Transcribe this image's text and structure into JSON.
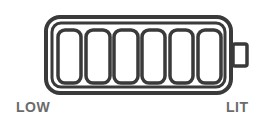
{
  "indicator": {
    "type": "battery-level",
    "segment_count": 6,
    "colors": {
      "stroke": "#3a3a3a",
      "label": "#6b6b6b",
      "background": "#ffffff"
    }
  },
  "labels": {
    "left": "LOW",
    "right": "LIT"
  }
}
